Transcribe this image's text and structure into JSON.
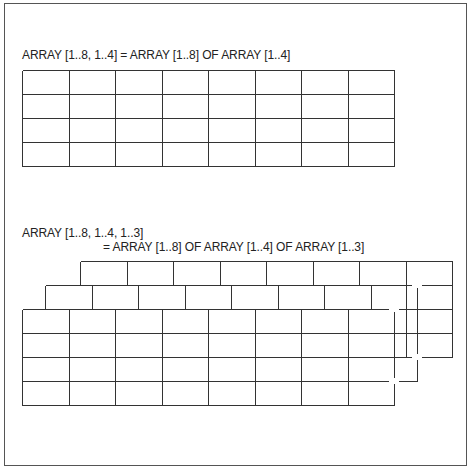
{
  "diagram": {
    "top": {
      "label": "ARRAY [1..8, 1..4] = ARRAY [1..8] OF ARRAY [1..4]",
      "grid": {
        "x": 22,
        "y": 70,
        "cols": 8,
        "rows": 4,
        "cell_w": 46.5,
        "cell_h": 24
      }
    },
    "bottom": {
      "label_line1": "ARRAY [1..8, 1..4, 1..3]",
      "label_line2": "= ARRAY [1..8] OF ARRAY [1..4] OF ARRAY [1..3]",
      "layers": [
        {
          "name": "back",
          "x": 80,
          "y": 261,
          "cols": 8,
          "rows": 4,
          "cell_w": 46.5,
          "cell_h": 24
        },
        {
          "name": "middle",
          "x": 45,
          "y": 285,
          "cols": 8,
          "rows": 4,
          "cell_w": 46.5,
          "cell_h": 24
        },
        {
          "name": "front",
          "x": 22,
          "y": 309,
          "cols": 8,
          "rows": 4,
          "cell_w": 46.5,
          "cell_h": 24
        }
      ]
    },
    "colors": {
      "line": "#333333",
      "frame": "#555555",
      "background": "#ffffff"
    }
  }
}
